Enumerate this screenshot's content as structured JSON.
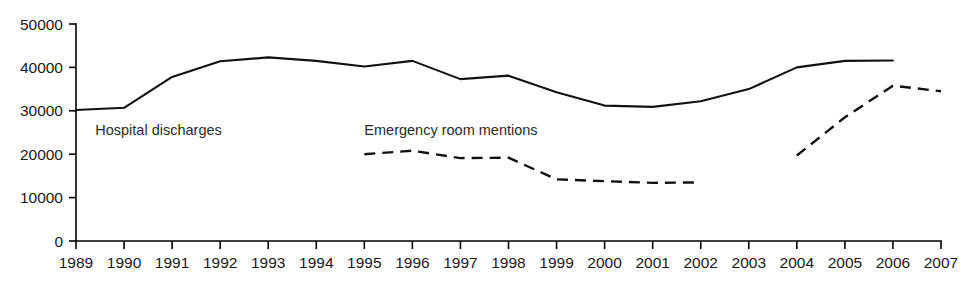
{
  "chart_data": {
    "type": "line",
    "title": "",
    "subtitle": "",
    "xlabel": "",
    "ylabel": "",
    "x": [
      1989,
      1990,
      1991,
      1992,
      1993,
      1994,
      1995,
      1996,
      1997,
      1998,
      1999,
      2000,
      2001,
      2002,
      2003,
      2004,
      2005,
      2006,
      2007
    ],
    "xtick_labels": [
      "1989",
      "1990",
      "1991",
      "1992",
      "1993",
      "1994",
      "1995",
      "1996",
      "1997",
      "1998",
      "1999",
      "2000",
      "2001",
      "2002",
      "2003",
      "2004",
      "2005",
      "2006",
      "2007"
    ],
    "ytick_labels": [
      "0",
      "10000",
      "20000",
      "30000",
      "40000",
      "50000"
    ],
    "ytick_values": [
      0,
      10000,
      20000,
      30000,
      40000,
      50000
    ],
    "ylim": [
      0,
      50000
    ],
    "xlim": [
      1989,
      2007
    ],
    "grid": false,
    "legend_position": "inline-annotation",
    "series": [
      {
        "name": "Hospital discharges",
        "style": "solid",
        "color": "#111111",
        "x": [
          1989,
          1990,
          1991,
          1992,
          1993,
          1994,
          1995,
          1996,
          1997,
          1998,
          1999,
          2000,
          2001,
          2002,
          2003,
          2004,
          2005,
          2006
        ],
        "values": [
          30200,
          30700,
          37800,
          41400,
          42300,
          41500,
          40200,
          41500,
          37300,
          38100,
          34300,
          31200,
          30900,
          32200,
          35000,
          40000,
          41500,
          41600
        ]
      },
      {
        "name": "Emergency room mentions",
        "style": "dashed",
        "color": "#111111",
        "segments": [
          {
            "x": [
              1995,
              1996,
              1997,
              1998,
              1999,
              2000,
              2001,
              2002
            ],
            "values": [
              20000,
              20800,
              19100,
              19200,
              14200,
              13800,
              13400,
              13500
            ]
          },
          {
            "x": [
              2004,
              2005,
              2006,
              2007
            ],
            "values": [
              19700,
              28500,
              35800,
              34500
            ]
          }
        ]
      }
    ],
    "annotations": [
      {
        "text": "Hospital discharges",
        "x": 1989.4,
        "y": 24500
      },
      {
        "text": "Emergency room mentions",
        "x": 1995.0,
        "y": 24500
      }
    ]
  },
  "axes": {
    "y_axis_name": "value-axis",
    "x_axis_name": "year-axis"
  }
}
